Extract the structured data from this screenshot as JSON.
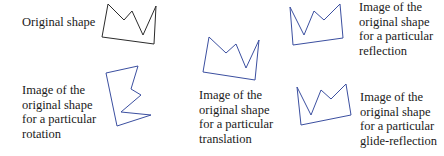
{
  "diagram": {
    "stroke_colors": {
      "original": "#2b2b2b",
      "images": "#3b4fa0"
    },
    "labels": {
      "original": "Original shape",
      "reflection": [
        "Image of the",
        "original shape",
        "for a particular",
        "reflection"
      ],
      "rotation": [
        "Image of the",
        "original shape",
        "for a particular",
        "rotation"
      ],
      "translation": [
        "Image of the",
        "original shape",
        "for a particular",
        "translation"
      ],
      "glide_reflection": [
        "Image of the",
        "original shape",
        "for a particular",
        "glide-reflection"
      ]
    },
    "shapes": {
      "original": "108,4 124,20 132,11 143,35 156,6 154,44 102,37",
      "translation": "209,37 226,53 236,44 246,68 259,40 255,80 203,72",
      "reflection": "290,7 304,35 314,11 324,20 340,4 343,38 293,45",
      "rotation": "106,73 138,66 131,89 141,95 121,112 151,115 117,126",
      "glide_reflection": "297,87 311,115 321,90 331,99 346,84 351,115 301,125"
    }
  }
}
